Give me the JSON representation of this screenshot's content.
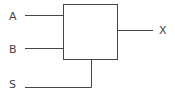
{
  "diagram": {
    "type": "multiplexer-block",
    "inputs": [
      {
        "label": "A"
      },
      {
        "label": "B"
      }
    ],
    "select": {
      "label": "S"
    },
    "output": {
      "label": "X"
    },
    "colors": {
      "stroke": "#444444",
      "background": "#ffffff"
    }
  }
}
